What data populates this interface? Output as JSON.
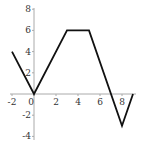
{
  "chart_data": {
    "type": "line",
    "title": "",
    "xlabel": "",
    "ylabel": "",
    "xlim": [
      -2,
      9
    ],
    "ylim": [
      -4,
      8
    ],
    "grid": false,
    "x_ticks": [
      -2,
      0,
      2,
      4,
      6,
      8
    ],
    "y_ticks": [
      -4,
      -2,
      2,
      4,
      6,
      8
    ],
    "series": [
      {
        "name": "f(x)",
        "color": "#111111",
        "points": [
          {
            "x": -2,
            "y": 4
          },
          {
            "x": 0,
            "y": 0
          },
          {
            "x": 3,
            "y": 6
          },
          {
            "x": 5,
            "y": 6
          },
          {
            "x": 8,
            "y": -3
          },
          {
            "x": 9,
            "y": 0
          }
        ]
      }
    ],
    "axis_color": "#aaaaaa"
  },
  "labels": {
    "x": [
      "-2",
      "0",
      "2",
      "4",
      "6",
      "8"
    ],
    "y": [
      "8",
      "6",
      "4",
      "2",
      "-2",
      "-4"
    ]
  }
}
